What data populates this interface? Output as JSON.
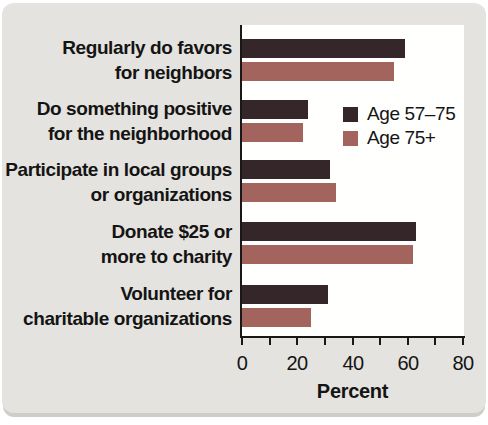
{
  "chart_data": {
    "type": "bar",
    "orientation": "horizontal",
    "title": "",
    "xlabel": "Percent",
    "ylabel": "",
    "xlim": [
      0,
      80
    ],
    "xticks_labeled": [
      0,
      20,
      40,
      60,
      80
    ],
    "xticks_minor": [
      10,
      30,
      50,
      70
    ],
    "grid": false,
    "legend_position": "inside-upper-right",
    "categories": [
      {
        "line1": "Regularly do favors",
        "line2": "for neighbors"
      },
      {
        "line1": "Do something positive",
        "line2": "for the neighborhood"
      },
      {
        "line1": "Participate in local groups",
        "line2": "or organizations"
      },
      {
        "line1": "Donate $25 or",
        "line2": "more to charity"
      },
      {
        "line1": "Volunteer for",
        "line2": "charitable organizations"
      }
    ],
    "series": [
      {
        "name": "Age 57–75",
        "color": "#35262a",
        "values": [
          59,
          24,
          32,
          63,
          31
        ]
      },
      {
        "name": "Age 75+",
        "color": "#a2645c",
        "values": [
          55,
          22,
          34,
          62,
          25
        ]
      }
    ]
  },
  "colors": {
    "card_background": "#e5e3df",
    "plot_background": "#fffffe",
    "axis": "#1a1718",
    "text": "#141414",
    "card_shadow": "#cfcdc8"
  }
}
